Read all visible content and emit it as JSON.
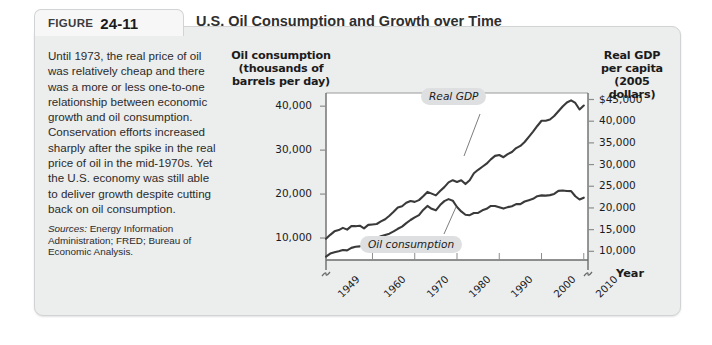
{
  "figure": {
    "tab_word": "FIGURE",
    "number": "24-11",
    "title": "U.S. Oil Consumption and Growth over Time"
  },
  "caption": {
    "body": "Until 1973, the real price of oil was relatively cheap and there was a more or less one-to-one relationship between economic growth and oil consumption. Conservation efforts increased sharply after the spike in the real price of oil in the mid-1970s. Yet the U.S. economy was still able to deliver growth despite cutting back on oil consumption.",
    "sources_label": "Sources:",
    "sources_text": " Energy Information Administration; FRED; Bureau of Economic Analysis."
  },
  "chart_data": {
    "type": "line",
    "title": "U.S. Oil Consumption and Growth over Time",
    "xlabel": "Year",
    "ylabel": "Oil consumption (thousands of barrels per day)",
    "y2label": "Real GDP per capita (2005 dollars)",
    "grid": false,
    "legend_position": "inline-annotations",
    "xlim": [
      1949,
      2011
    ],
    "xticks": [
      "1949",
      "1960",
      "1970",
      "1980",
      "1990",
      "2000",
      "2010"
    ],
    "xtick_values": [
      1949,
      1960,
      1970,
      1980,
      1990,
      2000,
      2010
    ],
    "axes": {
      "left": {
        "label": "Oil consumption (thousands of barrels per day)",
        "ticks": [
          "40,000",
          "30,000",
          "20,000",
          "10,000"
        ],
        "tick_values": [
          40000,
          30000,
          20000,
          10000
        ],
        "ylim": [
          5000,
          43000
        ],
        "axis_break": true
      },
      "right": {
        "label": "Real GDP per capita (2005 dollars)",
        "ticks": [
          "$45,000",
          "40,000",
          "35,000",
          "30,000",
          "25,000",
          "20,000",
          "15,000",
          "10,000"
        ],
        "tick_values": [
          45000,
          40000,
          35000,
          30000,
          25000,
          20000,
          15000,
          10000
        ],
        "ylim": [
          8000,
          46500
        ],
        "axis_break": true
      }
    },
    "annotations": [
      {
        "name": "Real GDP",
        "series": "real_gdp_per_capita"
      },
      {
        "name": "Oil consumption",
        "series": "oil_consumption"
      }
    ],
    "series": [
      {
        "name": "Oil consumption",
        "axis": "left",
        "units": "thousands of barrels per day",
        "x": [
          1949,
          1950,
          1951,
          1952,
          1953,
          1954,
          1955,
          1956,
          1957,
          1958,
          1959,
          1960,
          1961,
          1962,
          1963,
          1964,
          1965,
          1966,
          1967,
          1968,
          1969,
          1970,
          1971,
          1972,
          1973,
          1974,
          1975,
          1976,
          1977,
          1978,
          1979,
          1980,
          1981,
          1982,
          1983,
          1984,
          1985,
          1986,
          1987,
          1988,
          1989,
          1990,
          1991,
          1992,
          1993,
          1994,
          1995,
          1996,
          1997,
          1998,
          1999,
          2000,
          2001,
          2002,
          2003,
          2004,
          2005,
          2006,
          2007,
          2008,
          2009,
          2010
        ],
        "y": [
          5760,
          6460,
          6760,
          7000,
          7270,
          7200,
          7760,
          8000,
          8100,
          8450,
          8900,
          9800,
          9950,
          10400,
          10700,
          11000,
          11500,
          12100,
          12600,
          13400,
          14100,
          14700,
          15200,
          16400,
          17300,
          16650,
          16300,
          17500,
          18400,
          18850,
          18500,
          17050,
          16050,
          15300,
          15200,
          15700,
          15700,
          16300,
          16650,
          17300,
          17300,
          16990,
          16700,
          17030,
          17240,
          17720,
          17720,
          18310,
          18620,
          18920,
          19520,
          19700,
          19650,
          19760,
          20030,
          20730,
          20800,
          20690,
          20680,
          19500,
          18770,
          19180
        ]
      },
      {
        "name": "Real GDP per capita",
        "axis": "right",
        "units": "2005 dollars",
        "x": [
          1949,
          1950,
          1951,
          1952,
          1953,
          1954,
          1955,
          1956,
          1957,
          1958,
          1959,
          1960,
          1961,
          1962,
          1963,
          1964,
          1965,
          1966,
          1967,
          1968,
          1969,
          1970,
          1971,
          1972,
          1973,
          1974,
          1975,
          1976,
          1977,
          1978,
          1979,
          1980,
          1981,
          1982,
          1983,
          1984,
          1985,
          1986,
          1987,
          1988,
          1989,
          1990,
          1991,
          1992,
          1993,
          1994,
          1995,
          1996,
          1997,
          1998,
          1999,
          2000,
          2001,
          2002,
          2003,
          2004,
          2005,
          2006,
          2007,
          2008,
          2009,
          2010
        ],
        "y": [
          12900,
          13800,
          14600,
          14900,
          15400,
          15000,
          15800,
          15800,
          15900,
          15300,
          16100,
          16200,
          16300,
          16900,
          17400,
          18200,
          19100,
          20100,
          20400,
          21200,
          21600,
          21400,
          21800,
          22700,
          23700,
          23300,
          22900,
          23900,
          24800,
          25900,
          26400,
          26000,
          26400,
          25500,
          26400,
          28000,
          28800,
          29500,
          30200,
          31200,
          32000,
          32200,
          31700,
          32400,
          32900,
          33800,
          34300,
          35200,
          36400,
          37600,
          38900,
          40100,
          40100,
          40400,
          41200,
          42300,
          43400,
          44300,
          44800,
          44200,
          42700,
          43600
        ]
      }
    ]
  },
  "colors": {
    "panel_bg": "#eceded",
    "plot_bg": "#ffffff",
    "line": "#3a3a3a",
    "annotation_bg": "#dedfe0",
    "text": "#1b1b1b"
  }
}
